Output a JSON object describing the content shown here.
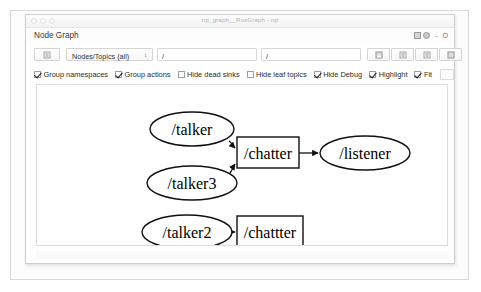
{
  "window": {
    "title": "rqt_graph__RosGraph - rqt",
    "traffic_lights": [
      "close",
      "minimize",
      "zoom"
    ]
  },
  "dock": {
    "title": "Node Graph",
    "buttons": [
      "undock-icon",
      "help-icon"
    ],
    "minimize_label": "-",
    "close_label": "O"
  },
  "toolbar": {
    "refresh_button": "refresh-icon",
    "combo": {
      "selected": "Nodes/Topics (all)",
      "arrow": "↕",
      "options": [
        "Nodes only",
        "Nodes/Topics (active)",
        "Nodes/Topics (all)"
      ]
    },
    "filters": [
      {
        "name": "include-filter",
        "value": "/"
      },
      {
        "name": "exclude-filter",
        "value": "/"
      }
    ],
    "right_buttons": [
      {
        "name": "save-dot-button",
        "icon": "floppy-disk-icon"
      },
      {
        "name": "save-image-button",
        "icon": "document-icon"
      },
      {
        "name": "save-svg-button",
        "icon": "document-icon"
      },
      {
        "name": "load-button",
        "icon": "box-icon"
      }
    ]
  },
  "options": [
    {
      "label": "Group namespaces",
      "checked": true
    },
    {
      "label": "Group actions",
      "checked": true
    },
    {
      "label": "Hide dead sinks",
      "checked": false
    },
    {
      "label": "Hide leaf topics",
      "checked": false
    },
    {
      "label": "Hide Debug",
      "checked": true
    },
    {
      "label": "Highlight",
      "checked": true
    },
    {
      "label": "Fit",
      "checked": true
    }
  ],
  "graph": {
    "nodes": [
      {
        "id": "talker",
        "label": "/talker",
        "shape": "ellipse",
        "cx": 155,
        "cy": 44,
        "rx": 42,
        "ry": 17
      },
      {
        "id": "talker3",
        "label": "/talker3",
        "shape": "ellipse",
        "cx": 155,
        "cy": 98,
        "rx": 45,
        "ry": 17
      },
      {
        "id": "chatter",
        "label": "/chatter",
        "shape": "box",
        "x": 200,
        "y": 52,
        "w": 62,
        "h": 31
      },
      {
        "id": "listener",
        "label": "/listener",
        "shape": "ellipse",
        "cx": 328,
        "cy": 68,
        "rx": 45,
        "ry": 17
      },
      {
        "id": "talker2",
        "label": "/talker2",
        "shape": "ellipse",
        "cx": 150,
        "cy": 147,
        "rx": 45,
        "ry": 17
      },
      {
        "id": "chattter",
        "label": "/chattter",
        "shape": "box",
        "x": 200,
        "y": 131,
        "w": 66,
        "h": 31
      }
    ],
    "edges": [
      {
        "from": "talker",
        "to": "chatter"
      },
      {
        "from": "talker3",
        "to": "chatter"
      },
      {
        "from": "chatter",
        "to": "listener"
      },
      {
        "from": "talker2",
        "to": "chattter"
      }
    ]
  },
  "colors": {
    "node_stroke": "#111111",
    "node_fill": "#ffffff",
    "edge": "#111111",
    "canvas_bg": "#ffffff"
  }
}
